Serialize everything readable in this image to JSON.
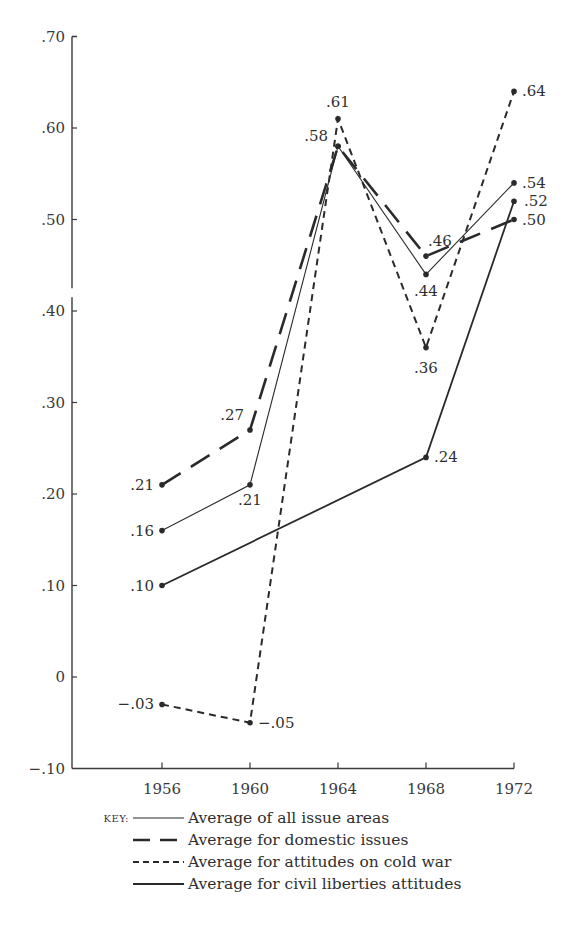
{
  "chart_data": {
    "type": "line",
    "title": "",
    "xlabel": "",
    "ylabel": "",
    "x": [
      1956,
      1960,
      1964,
      1968,
      1972
    ],
    "x_tick_labels": [
      "1956",
      "1960",
      "1964",
      "1968",
      "1972"
    ],
    "y_tick_values": [
      0.7,
      0.6,
      0.5,
      0.4,
      0.3,
      0.2,
      0.1,
      0,
      -0.1
    ],
    "y_tick_labels": [
      ".70",
      ".60",
      ".50",
      ".40",
      ".30",
      ".20",
      ".10",
      "0",
      "−.10"
    ],
    "ylim": [
      -0.1,
      0.7
    ],
    "grid": false,
    "legend_position": "bottom",
    "legend_prefix": "KEY:",
    "series": [
      {
        "name": "Average of all issue areas",
        "style": "thin-solid",
        "x": [
          1956,
          1960,
          1964,
          1968,
          1972
        ],
        "values": [
          0.16,
          0.21,
          0.58,
          0.44,
          0.54
        ],
        "labels": [
          ".16",
          ".21",
          ".58",
          ".44",
          ".54"
        ]
      },
      {
        "name": "Average for domestic issues",
        "style": "long-dash",
        "x": [
          1956,
          1960,
          1964,
          1968,
          1972
        ],
        "values": [
          0.21,
          0.27,
          0.58,
          0.46,
          0.5
        ],
        "labels": [
          ".21",
          ".27",
          "",
          ".46",
          ".50"
        ]
      },
      {
        "name": "Average for attitudes on cold war",
        "style": "short-dash",
        "x": [
          1956,
          1960,
          1964,
          1968,
          1972
        ],
        "values": [
          -0.03,
          -0.05,
          0.61,
          0.36,
          0.64
        ],
        "labels": [
          "−.03",
          "−.05",
          ".61",
          ".36",
          ".64"
        ]
      },
      {
        "name": "Average for civil liberties attitudes",
        "style": "thick-solid",
        "x": [
          1956,
          1968,
          1972
        ],
        "values": [
          0.1,
          0.24,
          0.52
        ],
        "labels": [
          ".10",
          ".24",
          ".52"
        ]
      }
    ],
    "colors": {
      "ink": "#2a2a2a",
      "axis": "#3a3a3a",
      "background": "#ffffff"
    }
  }
}
